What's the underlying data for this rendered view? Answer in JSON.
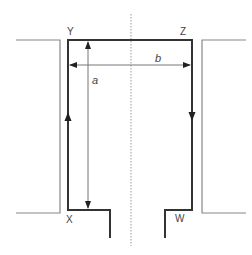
{
  "diagram": {
    "title": "",
    "corner_labels": {
      "top_left": "Y",
      "top_right": "Z",
      "bottom_left": "X",
      "bottom_right": "W"
    },
    "dimension_labels": {
      "height": "a",
      "width": "b"
    },
    "colors": {
      "loop": "#333333",
      "outer": "#888888",
      "dimension": "#777777",
      "centerline": "#999999"
    },
    "current_direction": [
      "X to Y (up left side)",
      "Z to W (down right side)"
    ]
  }
}
